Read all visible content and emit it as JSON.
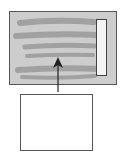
{
  "diagram": {
    "colors": {
      "panel_fill": "#cdcdcd",
      "panel_border": "#555555",
      "scribble": "#999999",
      "scrollbar_fill": "#f4f4f4",
      "scrollbar_border": "#444444",
      "box_fill": "#ffffff",
      "box_border": "#555555",
      "arrow": "#222222"
    },
    "scribble_lines": 6
  }
}
